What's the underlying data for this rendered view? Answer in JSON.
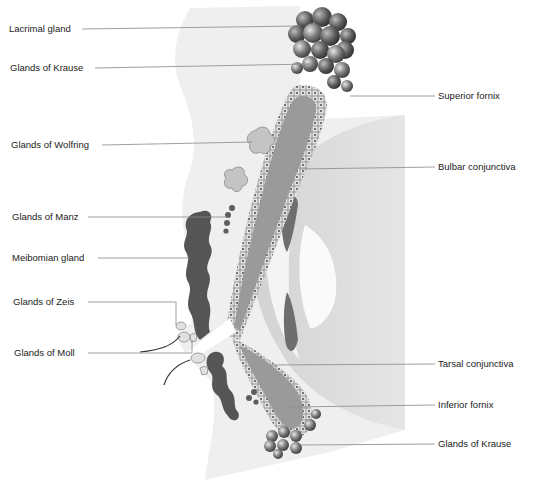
{
  "diagram": {
    "colors": {
      "background": "#ffffff",
      "lid_tissue": "#ececec",
      "globe": "#dcdcdc",
      "conjunctiva_fill": "#9a9a9a",
      "epithelium": "#d8d8d8",
      "dark_gland": "#555555",
      "light_gland": "#c4c4c4",
      "leader_line": "#888888",
      "label_text": "#222222"
    },
    "labels_left": [
      {
        "id": "lacrimal-gland",
        "text": "Lacrimal gland"
      },
      {
        "id": "glands-of-krause-upper",
        "text": "Glands of Krause"
      },
      {
        "id": "glands-of-wolfring",
        "text": "Glands of Wolfring"
      },
      {
        "id": "glands-of-manz",
        "text": "Glands of Manz"
      },
      {
        "id": "meibomian-gland",
        "text": "Meibomian gland"
      },
      {
        "id": "glands-of-zeis",
        "text": "Glands of Zeis"
      },
      {
        "id": "glands-of-moll",
        "text": "Glands of Moll"
      }
    ],
    "labels_right": [
      {
        "id": "superior-fornix",
        "text": "Superior fornix"
      },
      {
        "id": "bulbar-conjunctiva",
        "text": "Bulbar conjunctiva"
      },
      {
        "id": "tarsal-conjunctiva",
        "text": "Tarsal conjunctiva"
      },
      {
        "id": "inferior-fornix",
        "text": "Inferior fornix"
      },
      {
        "id": "glands-of-krause-lower",
        "text": "Glands of Krause"
      }
    ]
  }
}
